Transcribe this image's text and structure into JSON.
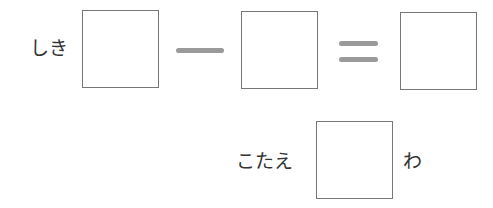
{
  "equation": {
    "label": "しき",
    "operator": "minus",
    "equals": "equals",
    "boxes": [
      "",
      "",
      ""
    ]
  },
  "answer": {
    "label": "こたえ",
    "box": "",
    "unit": "わ"
  }
}
